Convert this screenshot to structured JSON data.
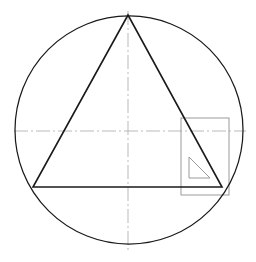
{
  "document": {
    "title": "Equilateral triangle inscribed in a circle",
    "canvas": {
      "width": 256,
      "height": 262,
      "background": "#ffffff"
    }
  },
  "colors": {
    "outline": "#1a1a1a",
    "centerline": "#b9b9b9",
    "guide_grey": "#9a9a9a",
    "background": "#ffffff"
  },
  "chart_data": {
    "type": "diagram",
    "units": "pixels",
    "shapes": [
      {
        "name": "circumscribed-circle",
        "kind": "circle",
        "cx": 129,
        "cy": 130,
        "r": 114,
        "stroke": "#1a1a1a",
        "stroke_width": 1.25,
        "fill": "none"
      },
      {
        "name": "inscribed-triangle",
        "kind": "polygon",
        "points": [
          [
            128,
            15
          ],
          [
            33,
            187
          ],
          [
            222,
            187
          ]
        ],
        "vertex_labels": [
          "apex",
          "bottom-left",
          "bottom-right"
        ],
        "stroke": "#1a1a1a",
        "stroke_width": 1.6,
        "fill": "none"
      },
      {
        "name": "horizontal-centerline",
        "kind": "line",
        "x1": 14,
        "y1": 131,
        "x2": 246,
        "y2": 131,
        "stroke": "#b9b9b9",
        "stroke_width": 1,
        "dash": "14,3,2,3"
      },
      {
        "name": "vertical-centerline",
        "kind": "line",
        "x1": 128,
        "y1": 11,
        "x2": 128,
        "y2": 253,
        "stroke": "#b9b9b9",
        "stroke_width": 1,
        "dash": "14,3,2,3"
      },
      {
        "name": "set-square-outline",
        "kind": "rect",
        "x": 181,
        "y": 118,
        "width": 48,
        "height": 77,
        "stroke": "#9a9a9a",
        "stroke_width": 1,
        "fill": "none"
      },
      {
        "name": "right-angle-marker-triangle",
        "kind": "polygon",
        "points": [
          [
            189,
            157
          ],
          [
            189,
            178
          ],
          [
            210,
            178
          ]
        ],
        "stroke": "#9a9a9a",
        "stroke_width": 1,
        "fill": "none"
      }
    ],
    "annotations": []
  }
}
